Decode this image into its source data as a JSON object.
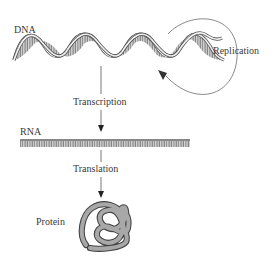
{
  "diagram": {
    "nodes": [
      {
        "id": "dna",
        "label": "DNA"
      },
      {
        "id": "rna",
        "label": "RNA"
      },
      {
        "id": "protein",
        "label": "Protein"
      }
    ],
    "edges": [
      {
        "from": "dna",
        "to": "dna",
        "label": "Replication"
      },
      {
        "from": "dna",
        "to": "rna",
        "label": "Transcription"
      },
      {
        "from": "rna",
        "to": "protein",
        "label": "Translation"
      }
    ],
    "colors": {
      "helix_fill": "#8c8c8c",
      "strand_edge": "#555555",
      "rna_bar": "#9a9a9a",
      "protein_fill": "#a0a0a0",
      "line": "#555555"
    }
  }
}
